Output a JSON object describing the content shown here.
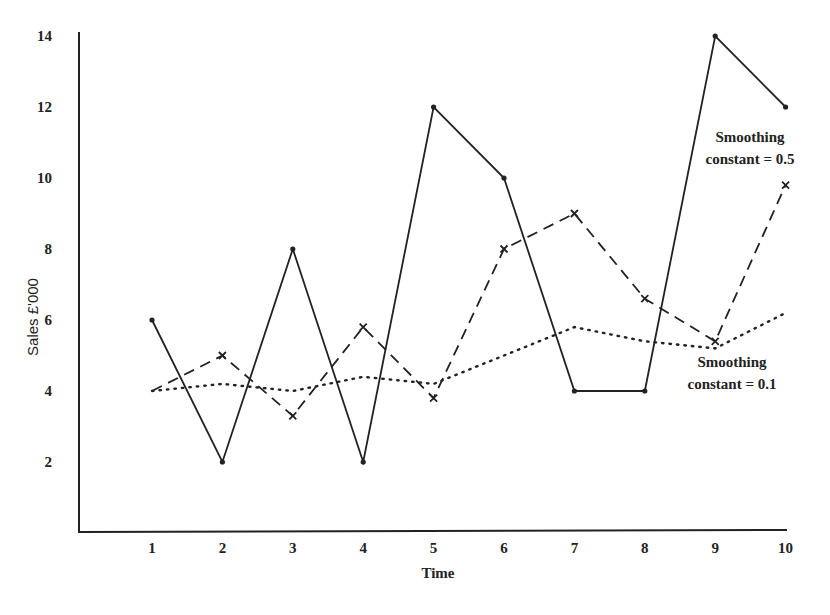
{
  "chart_data": {
    "type": "line",
    "title": "",
    "xlabel": "Time",
    "ylabel": "Sales £'000",
    "x": [
      1,
      2,
      3,
      4,
      5,
      6,
      7,
      8,
      9,
      10
    ],
    "xticks": [
      "1",
      "2",
      "3",
      "4",
      "5",
      "6",
      "7",
      "8",
      "9",
      "10"
    ],
    "yticks": [
      "2",
      "4",
      "6",
      "8",
      "10",
      "12",
      "14"
    ],
    "ytick_values": [
      2,
      4,
      6,
      8,
      10,
      12,
      14
    ],
    "ylim": [
      0,
      14
    ],
    "xlim": [
      0,
      10
    ],
    "grid": false,
    "legend": "none (inline annotations)",
    "series": [
      {
        "name": "Actual sales",
        "style": "solid",
        "marker": "dot",
        "values": [
          6,
          2,
          8,
          2,
          12,
          10,
          4,
          4,
          14,
          12
        ]
      },
      {
        "name": "Smoothing constant = 0.5",
        "style": "dashed",
        "marker": "x",
        "values": [
          4,
          5,
          3.3,
          5.8,
          3.8,
          8,
          9,
          6.6,
          5.4,
          9.8
        ]
      },
      {
        "name": "Smoothing constant = 0.1",
        "style": "dotted",
        "marker": "none",
        "values": [
          4,
          4.2,
          4.0,
          4.4,
          4.2,
          5.0,
          5.8,
          5.4,
          5.2,
          6.2
        ]
      }
    ],
    "annotations": [
      {
        "lines": [
          "Smoothing",
          "constant = 0.5"
        ],
        "x": 9.6,
        "y": 10.5
      },
      {
        "lines": [
          "Smoothing",
          "constant = 0.1"
        ],
        "x": 8.4,
        "y": 4.5
      }
    ]
  }
}
